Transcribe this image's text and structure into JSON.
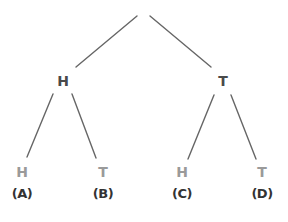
{
  "diagram": {
    "type": "probability-tree",
    "colors": {
      "line": "#666666",
      "internal_node": "#4a4a4a",
      "leaf_node": "#9a9a9a",
      "label": "#333333"
    },
    "level1": [
      {
        "text": "H",
        "x": 63,
        "y": 81
      },
      {
        "text": "T",
        "x": 223,
        "y": 81
      }
    ],
    "leaves": [
      {
        "text": "H",
        "label": "(A)",
        "x": 22,
        "y": 172,
        "ly": 194
      },
      {
        "text": "T",
        "label": "(B)",
        "x": 103,
        "y": 172,
        "ly": 194
      },
      {
        "text": "H",
        "label": "(C)",
        "x": 182,
        "y": 172,
        "ly": 194
      },
      {
        "text": "T",
        "label": "(D)",
        "x": 262,
        "y": 172,
        "ly": 194
      }
    ]
  }
}
